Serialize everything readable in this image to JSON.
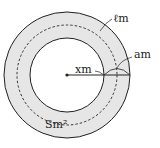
{
  "diagram": {
    "labels": {
      "path_length": "ℓm",
      "path_width": "am",
      "radius": "xm",
      "area": "Sm²"
    },
    "colors": {
      "ring_fill": "#e6e6e6",
      "stroke": "#222222",
      "background": "#ffffff"
    }
  }
}
